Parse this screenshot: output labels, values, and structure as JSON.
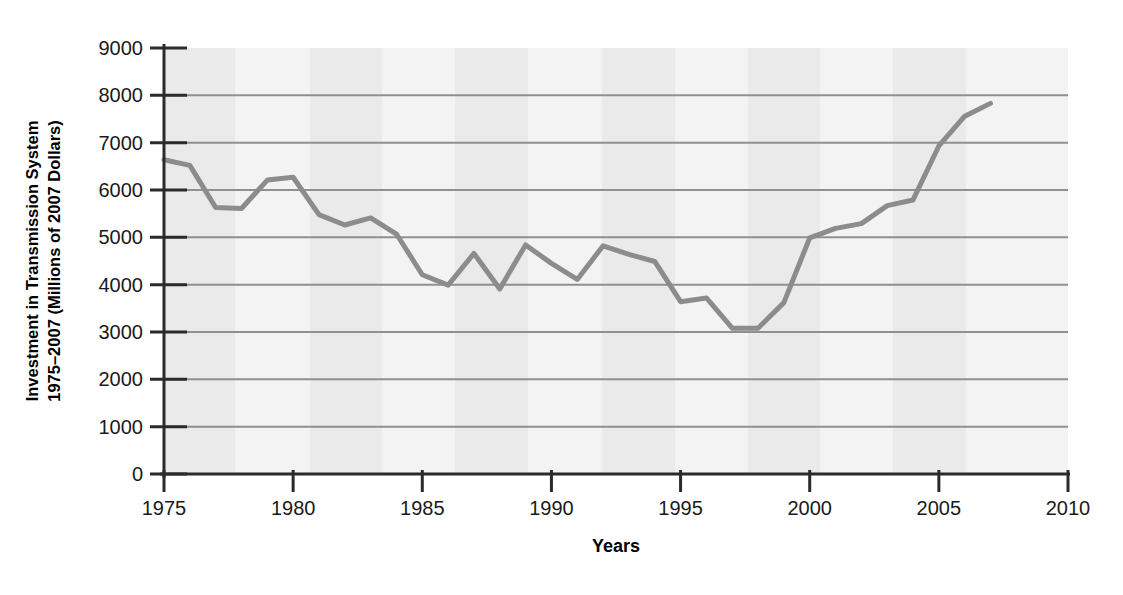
{
  "chart_data": {
    "type": "line",
    "title": "",
    "subtitle": "",
    "xlabel": "Years",
    "ylabel": "Investment in Transmission System 1975–2007 (Millions of 2007 Dollars)",
    "ylabel_line1": "Investment in Transmission System",
    "ylabel_line2": "1975–2007 (Millions of 2007 Dollars)",
    "xlim": [
      1975,
      2010
    ],
    "ylim": [
      0,
      9000
    ],
    "xticks": [
      1975,
      1980,
      1985,
      1990,
      1995,
      2000,
      2005,
      2010
    ],
    "xticklabels": [
      "1975",
      "1980",
      "1985",
      "1990",
      "1995",
      "2000",
      "2005",
      "2010"
    ],
    "yticks": [
      0,
      1000,
      2000,
      3000,
      4000,
      5000,
      6000,
      7000,
      8000,
      9000
    ],
    "yticklabels": [
      "0",
      "1000",
      "2000",
      "3000",
      "4000",
      "5000",
      "6000",
      "7000",
      "8000",
      "9000"
    ],
    "grid": "horizontal",
    "legend": "none",
    "line_color": "#8c8c8c",
    "grid_color": "#909090",
    "axis_color": "#2b2b2b",
    "plot_background": "#f2f2f2",
    "band_color": "#eaeaea",
    "x": [
      1975,
      1976,
      1977,
      1978,
      1979,
      1980,
      1981,
      1982,
      1983,
      1984,
      1985,
      1986,
      1987,
      1988,
      1989,
      1990,
      1991,
      1992,
      1993,
      1994,
      1995,
      1996,
      1997,
      1998,
      1999,
      2000,
      2001,
      2002,
      2003,
      2004,
      2005,
      2006,
      2007
    ],
    "values": [
      6640,
      6520,
      5630,
      5610,
      6210,
      6270,
      5480,
      5260,
      5410,
      5070,
      4210,
      3990,
      4660,
      3910,
      4840,
      4450,
      4110,
      4820,
      4640,
      4490,
      3640,
      3720,
      3080,
      3080,
      3620,
      4990,
      5190,
      5290,
      5670,
      5790,
      6930,
      7560,
      7830
    ],
    "series": [
      {
        "name": "Investment in Transmission System",
        "values": [
          6640,
          6520,
          5630,
          5610,
          6210,
          6270,
          5480,
          5260,
          5410,
          5070,
          4210,
          3990,
          4660,
          3910,
          4840,
          4450,
          4110,
          4820,
          4640,
          4490,
          3640,
          3720,
          3080,
          3080,
          3620,
          4990,
          5190,
          5290,
          5670,
          5790,
          6930,
          7560,
          7830
        ]
      }
    ]
  }
}
